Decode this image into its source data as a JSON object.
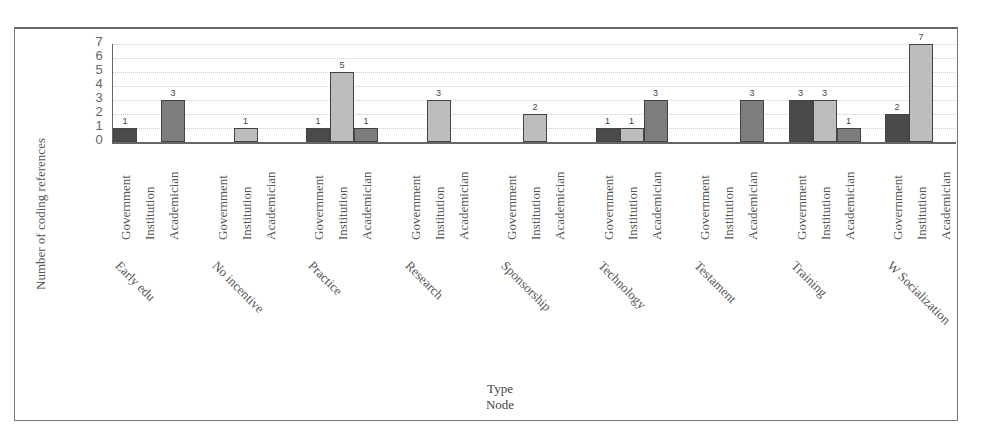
{
  "chart_data": {
    "type": "bar",
    "title": "",
    "xlabel": "Type\nNode",
    "xlabel_lines": [
      "Type",
      "Node"
    ],
    "ylabel": "Number of coding references",
    "ylim": [
      0,
      7
    ],
    "yticks": [
      "0",
      "1",
      "2",
      "3",
      "4",
      "5",
      "6",
      "7"
    ],
    "grid": true,
    "legend": "none (sub-categories labeled on x axis)",
    "groups": [
      "Early edu",
      "No incentive",
      "Practice",
      "Research",
      "Sponsorship",
      "Technology",
      "Testament",
      "Training",
      "W Socialization"
    ],
    "sub_categories": [
      "Government",
      "Institution",
      "Academician"
    ],
    "series": [
      {
        "name": "Government",
        "color": "#4a4a4a",
        "values": [
          1,
          0,
          1,
          0,
          0,
          1,
          0,
          3,
          2
        ]
      },
      {
        "name": "Institution",
        "color": "#bdbdbd",
        "values": [
          0,
          1,
          5,
          3,
          2,
          1,
          0,
          3,
          7
        ]
      },
      {
        "name": "Academician",
        "color": "#7d7d7d",
        "values": [
          3,
          0,
          1,
          0,
          0,
          3,
          3,
          1,
          0
        ]
      }
    ]
  }
}
